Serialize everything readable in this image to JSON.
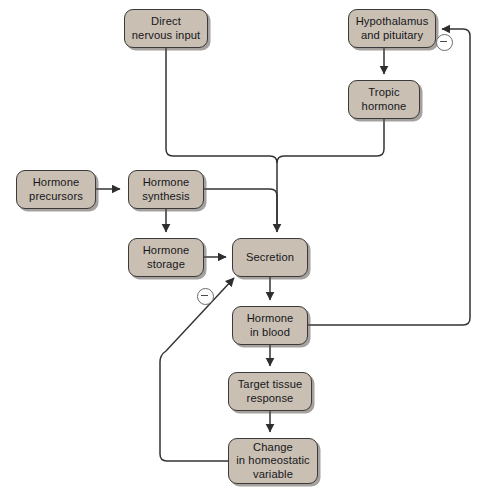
{
  "diagram": {
    "background_color": "#ffffff",
    "node_fill_color": "#c9bfb3",
    "node_border_color": "#3a3a3a",
    "line_color": "#333333",
    "nodes": [
      {
        "id": "direct-nervous-input",
        "label": "Direct\nnervous input",
        "x": 124,
        "y": 9,
        "w": 84,
        "h": 39
      },
      {
        "id": "hypothalamus-and-pituitary",
        "label": "Hypothalamus\nand pituitary",
        "x": 348,
        "y": 9,
        "w": 88,
        "h": 39
      },
      {
        "id": "tropic-hormone",
        "label": "Tropic\nhormone",
        "x": 348,
        "y": 80,
        "w": 72,
        "h": 39
      },
      {
        "id": "hormone-precursors",
        "label": "Hormone\nprecursors",
        "x": 16,
        "y": 170,
        "w": 80,
        "h": 39
      },
      {
        "id": "hormone-synthesis",
        "label": "Hormone\nsynthesis",
        "x": 128,
        "y": 170,
        "w": 76,
        "h": 39
      },
      {
        "id": "hormone-storage",
        "label": "Hormone\nstorage",
        "x": 128,
        "y": 238,
        "w": 76,
        "h": 39
      },
      {
        "id": "secretion",
        "label": "Secretion",
        "x": 232,
        "y": 238,
        "w": 76,
        "h": 39
      },
      {
        "id": "hormone-in-blood",
        "label": "Hormone\nin blood",
        "x": 232,
        "y": 306,
        "w": 76,
        "h": 39
      },
      {
        "id": "target-tissue-response",
        "label": "Target tissue\nresponse",
        "x": 228,
        "y": 372,
        "w": 84,
        "h": 39
      },
      {
        "id": "change-in-homeostatic-variable",
        "label": "Change\nin homeostatic\nvariable",
        "x": 228,
        "y": 438,
        "w": 90,
        "h": 46
      }
    ],
    "feedback_markers": [
      {
        "id": "negative-feedback-long-loop",
        "symbol": "minus",
        "x": 436,
        "y": 34
      },
      {
        "id": "negative-feedback-short-loop",
        "symbol": "minus",
        "x": 197,
        "y": 288
      }
    ],
    "connections": [
      {
        "from": "direct-nervous-input",
        "to": "secretion",
        "style": "elbow",
        "marker": "arrow"
      },
      {
        "from": "hypothalamus-and-pituitary",
        "to": "tropic-hormone",
        "style": "straight",
        "marker": "arrow"
      },
      {
        "from": "tropic-hormone",
        "to": "secretion",
        "style": "elbow",
        "marker": "arrow"
      },
      {
        "from": "hormone-precursors",
        "to": "hormone-synthesis",
        "style": "straight",
        "marker": "arrow"
      },
      {
        "from": "hormone-synthesis",
        "to": "hormone-storage",
        "style": "straight",
        "marker": "arrow"
      },
      {
        "from": "hormone-synthesis",
        "to": "secretion",
        "style": "elbow",
        "marker": "arrow"
      },
      {
        "from": "hormone-storage",
        "to": "secretion",
        "style": "straight",
        "marker": "arrow"
      },
      {
        "from": "secretion",
        "to": "hormone-in-blood",
        "style": "straight",
        "marker": "arrow"
      },
      {
        "from": "hormone-in-blood",
        "to": "target-tissue-response",
        "style": "straight",
        "marker": "arrow"
      },
      {
        "from": "target-tissue-response",
        "to": "change-in-homeostatic-variable",
        "style": "straight",
        "marker": "arrow"
      },
      {
        "from": "hormone-in-blood",
        "to": "hypothalamus-and-pituitary",
        "style": "elbow-right-loop",
        "marker": "arrow",
        "sign": "negative"
      },
      {
        "from": "change-in-homeostatic-variable",
        "to": "secretion",
        "style": "elbow-diagonal",
        "marker": "arrow",
        "sign": "negative"
      }
    ]
  }
}
